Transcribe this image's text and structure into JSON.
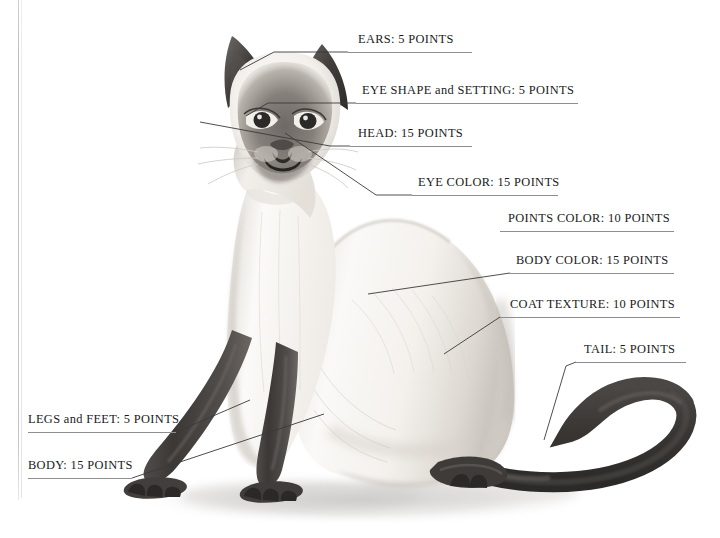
{
  "document": {
    "title": "Siamese Cat Point Score Diagram",
    "subject": "siamese-cat",
    "background_color": "#ffffff",
    "text_color": "#1a1a1a",
    "rule_color": "#8e8e8e",
    "leader_color": "#3a3a3a"
  },
  "labels": [
    {
      "id": "ears",
      "text": "EARS: 5 POINTS",
      "feature": "EARS",
      "points": "5 POINTS",
      "x": 358,
      "y": 32,
      "rule": {
        "x": 348,
        "y": 52,
        "width": 124
      },
      "leader": "M 348 52 L 274 52 L 240 70"
    },
    {
      "id": "eye-shape-and-setting",
      "text": "EYE SHAPE and SETTING: 5 POINTS",
      "feature": "EYE SHAPE and SETTING",
      "points": "5 POINTS",
      "x": 362,
      "y": 83,
      "rule": {
        "x": 356,
        "y": 103,
        "width": 222
      },
      "leader": "M 356 103 L 268 103 L 246 116"
    },
    {
      "id": "head",
      "text": "HEAD: 15 POINTS",
      "feature": "HEAD",
      "points": "15 POINTS",
      "x": 358,
      "y": 126,
      "rule": {
        "x": 350,
        "y": 146,
        "width": 122
      },
      "leader": "M 350 146 L 330 146 L 200 122"
    },
    {
      "id": "eye-color",
      "text": "EYE COLOR: 15 POINTS",
      "feature": "EYE COLOR",
      "points": "15 POINTS",
      "x": 418,
      "y": 175,
      "rule": {
        "x": 412,
        "y": 195,
        "width": 146
      },
      "leader": "M 412 195 L 376 195 L 285 133"
    },
    {
      "id": "points-color",
      "text": "POINTS COLOR: 10 POINTS",
      "feature": "POINTS COLOR",
      "points": "10 POINTS",
      "x": 508,
      "y": 211,
      "rule": {
        "x": 500,
        "y": 231,
        "width": 174
      },
      "leader": ""
    },
    {
      "id": "body-color",
      "text": "BODY COLOR: 15 POINTS",
      "feature": "BODY COLOR",
      "points": "15 POINTS",
      "x": 516,
      "y": 253,
      "rule": {
        "x": 510,
        "y": 273,
        "width": 164
      },
      "leader": "M 510 273 L 368 294"
    },
    {
      "id": "coat-texture",
      "text": "COAT TEXTURE: 10 POINTS",
      "feature": "COAT TEXTURE",
      "points": "10 POINTS",
      "x": 510,
      "y": 297,
      "rule": {
        "x": 500,
        "y": 317,
        "width": 180
      },
      "leader": "M 500 317 L 444 354"
    },
    {
      "id": "tail",
      "text": "TAIL: 5 POINTS",
      "feature": "TAIL",
      "points": "5 POINTS",
      "x": 584,
      "y": 342,
      "rule": {
        "x": 576,
        "y": 362,
        "width": 110
      },
      "leader": "M 576 362 L 566 366 L 544 440"
    },
    {
      "id": "legs-and-feet",
      "text": "LEGS and FEET: 5 POINTS",
      "feature": "LEGS and FEET",
      "points": "5 POINTS",
      "x": 28,
      "y": 412,
      "rule": {
        "x": 28,
        "y": 432,
        "width": 148
      },
      "leader": "M 176 432 L 250 400"
    },
    {
      "id": "body",
      "text": "BODY: 15 POINTS",
      "feature": "BODY",
      "points": "15 POINTS",
      "x": 28,
      "y": 458,
      "rule": {
        "x": 28,
        "y": 478,
        "width": 104
      },
      "leader": "M 132 478 L 324 414"
    }
  ],
  "artwork": {
    "name": "siamese-cat-seated",
    "description": "Seated Siamese cat, three-quarter view, pale cream body with dark seal points on the mask, ears, legs, feet and long curving tail, cast shadow on the ground.",
    "colors": {
      "body_light": "#f7f5f2",
      "body_shade": "#dcd8d2",
      "body_shade_deep": "#bfbab3",
      "points_dark": "#3f3c3a",
      "points_darker": "#2a2827",
      "points_mid": "#6b6764",
      "shadow": "#d8d6d4",
      "eye": "#2b2a2a"
    }
  }
}
